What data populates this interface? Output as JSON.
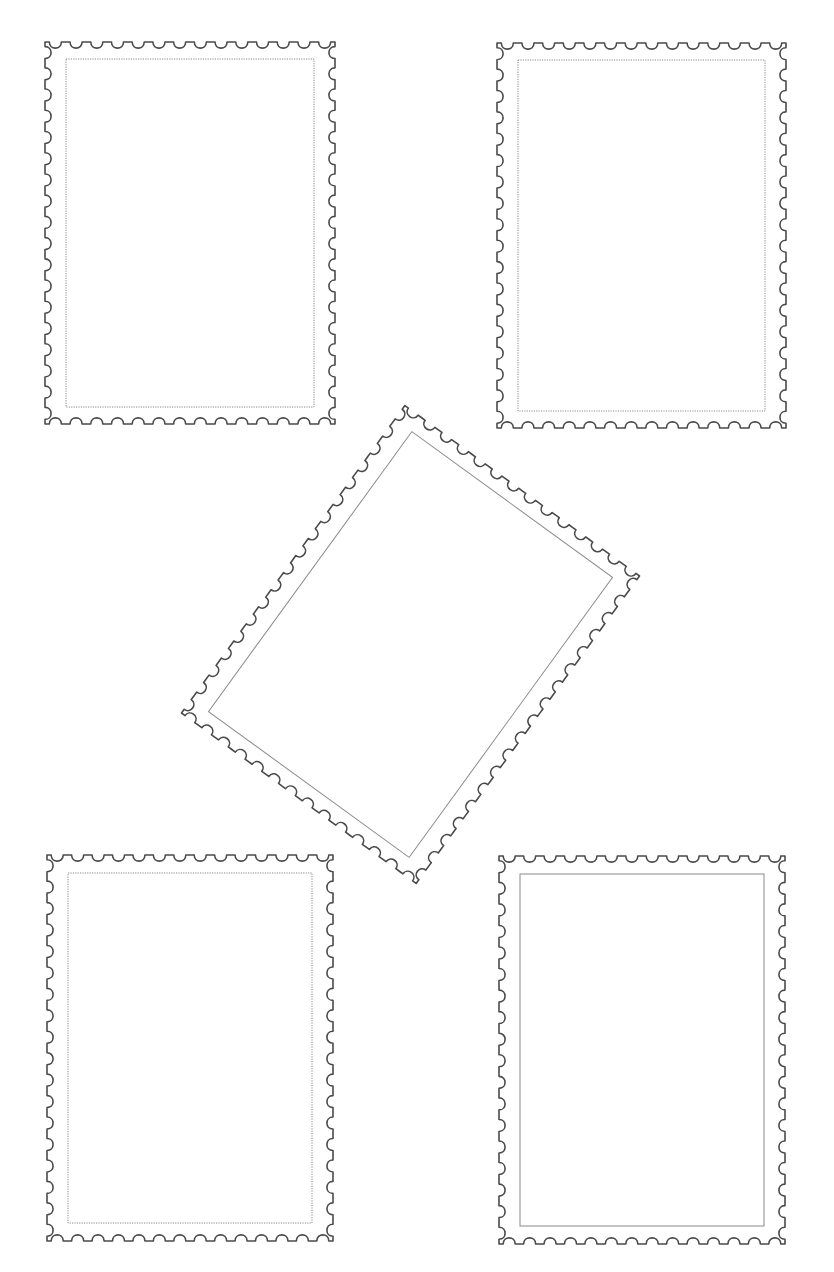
{
  "page": {
    "width": 834,
    "height": 1272,
    "background": "#ffffff"
  },
  "style": {
    "outer_stroke": "#4a4a4a",
    "inner_stroke": "#8a8a8a",
    "perforation_period": 21,
    "perforation_radius": 6
  },
  "stamps": [
    {
      "name": "stamp-top-left",
      "cx": 190,
      "cy": 233,
      "w": 290,
      "h": 382,
      "inset_x": 21,
      "inset_y": 17,
      "rotation": 0,
      "inner_style": "dotted"
    },
    {
      "name": "stamp-top-right",
      "cx": 641.5,
      "cy": 235.5,
      "w": 289,
      "h": 385,
      "inset_x": 21,
      "inset_y": 17,
      "rotation": 0,
      "inner_style": "dotted"
    },
    {
      "name": "stamp-center-rotated",
      "cx": 410.5,
      "cy": 644.5,
      "w": 290,
      "h": 380,
      "inset_x": 21,
      "inset_y": 17,
      "rotation": 36,
      "inner_style": "solid"
    },
    {
      "name": "stamp-bottom-left",
      "cx": 190,
      "cy": 1048,
      "w": 286,
      "h": 386,
      "inset_x": 21,
      "inset_y": 18,
      "rotation": 0,
      "inner_style": "dotted"
    },
    {
      "name": "stamp-bottom-right",
      "cx": 642,
      "cy": 1050,
      "w": 286,
      "h": 388,
      "inset_x": 21,
      "inset_y": 18,
      "rotation": 0,
      "inner_style": "solid"
    }
  ]
}
